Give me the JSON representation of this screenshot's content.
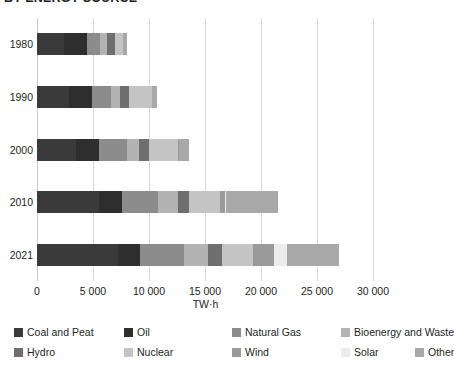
{
  "chart_data": {
    "type": "bar",
    "orientation": "horizontal",
    "stacked": true,
    "title": "BY ENERGY SOURCE",
    "xlabel": "TW·h",
    "ylabel": "",
    "xlim": [
      0,
      30000
    ],
    "xticks": [
      0,
      5000,
      10000,
      15000,
      20000,
      25000,
      30000
    ],
    "xticklabels": [
      "0",
      "5 000",
      "10 000",
      "15 000",
      "20 000",
      "25 000",
      "30 000"
    ],
    "grid": true,
    "legend_position": "bottom",
    "categories": [
      "1980",
      "1990",
      "2000",
      "2010",
      "2021"
    ],
    "series": [
      {
        "name": "Coal and Peat",
        "color": "#3a3a3a",
        "values": [
          2400,
          2900,
          3450,
          5500,
          7200
        ]
      },
      {
        "name": "Oil",
        "color": "#2e2e2e",
        "values": [
          2100,
          2000,
          2050,
          2100,
          2000
        ]
      },
      {
        "name": "Natural Gas",
        "color": "#8c8c8c",
        "values": [
          1100,
          1750,
          2500,
          3200,
          3900
        ]
      },
      {
        "name": "Bioenergy and Waste",
        "color": "#b3b3b3",
        "values": [
          650,
          800,
          1100,
          1750,
          2200
        ]
      },
      {
        "name": "Hydro",
        "color": "#6e6e6e",
        "values": [
          700,
          800,
          900,
          1050,
          1200
        ]
      },
      {
        "name": "Nuclear",
        "color": "#c4c4c4",
        "values": [
          730,
          2000,
          2600,
          2750,
          2800
        ]
      },
      {
        "name": "Wind",
        "color": "#9a9a9a",
        "values": [
          0,
          10,
          60,
          400,
          1900
        ]
      },
      {
        "name": "Solar",
        "color": "#ececec",
        "values": [
          0,
          5,
          20,
          120,
          1100
        ]
      },
      {
        "name": "Other",
        "color": "#a8a8a8",
        "values": [
          320,
          435,
          920,
          4630,
          4700
        ]
      }
    ],
    "totals": [
      8000,
      12200,
      15600,
      21500,
      27000
    ]
  },
  "legend_rows": [
    [
      "Coal and Peat",
      "Oil",
      "Natural Gas",
      "Bioenergy and Waste"
    ],
    [
      "Hydro",
      "Nuclear",
      "Wind",
      "Solar",
      "Other"
    ]
  ]
}
